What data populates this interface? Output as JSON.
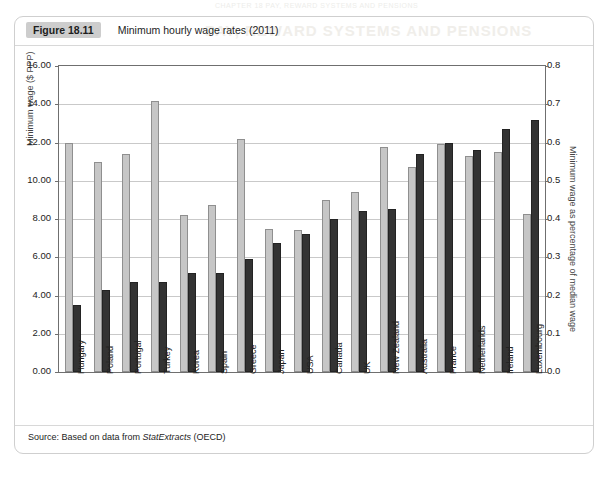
{
  "page": {
    "bleed_top_text": "CHAPTER 18  PAY, REWARD SYSTEMS AND PENSIONS",
    "bleed_watermark_text": "PAY, REWARD SYSTEMS AND PENSIONS"
  },
  "figure": {
    "badge": "Figure 18.11",
    "title": "Minimum hourly wage rates (2011)",
    "source_prefix": "Source: Based on data from ",
    "source_italic": "StatExtracts",
    "source_suffix": " (OECD)"
  },
  "chart_data": {
    "type": "bar",
    "title": "Minimum hourly wage rates (2011)",
    "xlabel": "",
    "ylabel": "Minimum wage ($ PPP)",
    "y2label": "Minimum wage as percentage of median wage",
    "ylim": [
      0,
      16
    ],
    "y2lim": [
      0,
      0.8
    ],
    "yticks": [
      "0.00",
      "2.00",
      "4.00",
      "6.00",
      "8.00",
      "10.00",
      "12.00",
      "14.00",
      "16.00"
    ],
    "y2ticks": [
      "0.0",
      "0.1",
      "0.2",
      "0.3",
      "0.4",
      "0.5",
      "0.6",
      "0.7",
      "0.8"
    ],
    "grid": true,
    "legend": "none",
    "categories": [
      "Hungary",
      "Poland",
      "Portugal",
      "Turkey",
      "Korea",
      "Spain",
      "Greece",
      "Japan",
      "USA",
      "Canada",
      "UK",
      "New Zealand",
      "Australia",
      "France",
      "Netherlands",
      "Ireland",
      "Luxembourg"
    ],
    "series": [
      {
        "name": "Minimum wage ($ PPP)",
        "axis": "left",
        "color": "#c6c6c6",
        "values": [
          12.0,
          11.0,
          11.4,
          14.15,
          8.2,
          8.75,
          12.2,
          7.5,
          7.4,
          9.0,
          9.4,
          11.75,
          10.7,
          11.9,
          11.3,
          11.5,
          8.25
        ]
      },
      {
        "name": "Minimum wage as percentage of median wage",
        "axis": "right",
        "color": "#333333",
        "values": [
          0.175,
          0.215,
          0.235,
          0.235,
          0.26,
          0.26,
          0.295,
          0.338,
          0.36,
          0.4,
          0.42,
          0.425,
          0.57,
          0.6,
          0.58,
          0.635,
          0.66
        ]
      }
    ]
  }
}
